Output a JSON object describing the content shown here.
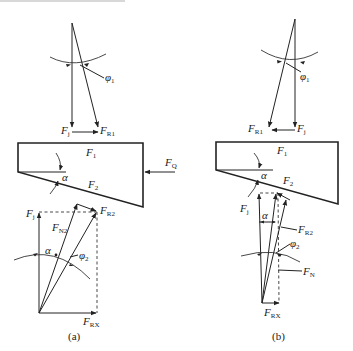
{
  "figure": {
    "a": {
      "caption": "(a)",
      "labels": {
        "phi1": {
          "main": "φ",
          "sub": "1"
        },
        "Fj_top": {
          "main": "F",
          "sub": "j"
        },
        "FR1": {
          "main": "F",
          "sub": "R1"
        },
        "F1": {
          "main": "F",
          "sub": "1"
        },
        "FQ": {
          "main": "F",
          "sub": "Q"
        },
        "alpha_block": {
          "main": "α"
        },
        "F2": {
          "main": "F",
          "sub": "2"
        },
        "Fj_bottom": {
          "main": "F",
          "sub": "j"
        },
        "FN2": {
          "main": "F",
          "sub": "N2"
        },
        "FR2": {
          "main": "F",
          "sub": "R2"
        },
        "alpha_lower": {
          "main": "α"
        },
        "phi2": {
          "main": "φ",
          "sub": "2"
        },
        "FRX": {
          "main": "F",
          "sub": "RX"
        }
      }
    },
    "b": {
      "caption": "(b)",
      "labels": {
        "phi1": {
          "main": "φ",
          "sub": "1"
        },
        "FR1": {
          "main": "F",
          "sub": "R1"
        },
        "Fj_top": {
          "main": "F",
          "sub": "j"
        },
        "F1": {
          "main": "F",
          "sub": "1"
        },
        "alpha_block": {
          "main": "α"
        },
        "F2": {
          "main": "F",
          "sub": "2"
        },
        "Fj_bottom": {
          "main": "F",
          "sub": "j"
        },
        "alpha_lower": {
          "main": "α"
        },
        "FR2": {
          "main": "F",
          "sub": "R2"
        },
        "phi2": {
          "main": "φ",
          "sub": "2"
        },
        "FN": {
          "main": "F",
          "sub": "N"
        },
        "FRX": {
          "main": "F",
          "sub": "RX"
        }
      }
    }
  }
}
